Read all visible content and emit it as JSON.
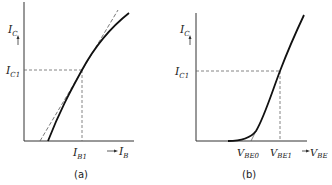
{
  "figure": {
    "panel_a": {
      "caption": "(a)",
      "y_axis_label": "I",
      "y_axis_sub": "C",
      "x_axis_label": "I",
      "x_axis_sub": "B",
      "y_tick_label": "I",
      "y_tick_sub": "C1",
      "x_tick_label": "I",
      "x_tick_sub": "B1"
    },
    "panel_b": {
      "caption": "(b)",
      "y_axis_label": "I",
      "y_axis_sub": "C",
      "x_axis_label": "V",
      "x_axis_sub": "BE",
      "y_tick_label": "I",
      "y_tick_sub": "C1",
      "x_tick0_label": "V",
      "x_tick0_sub": "BE0",
      "x_tick1_label": "V",
      "x_tick1_sub": "BE1"
    },
    "colors": {
      "line": "#1a1a1a",
      "dashed": "#555555"
    }
  }
}
